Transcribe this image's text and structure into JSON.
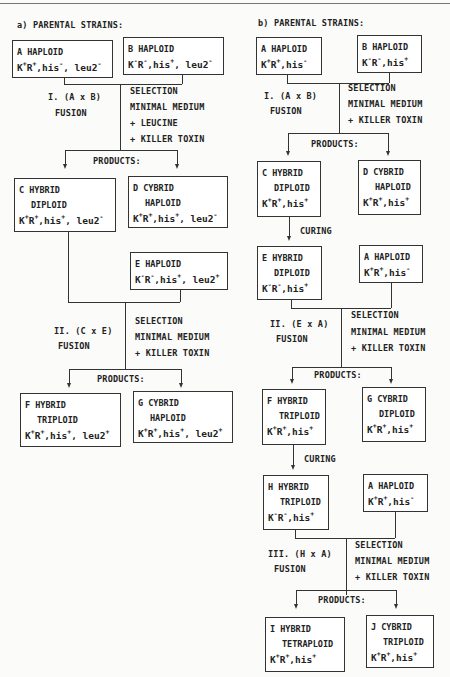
{
  "panel_a": {
    "title": "a) PARENTAL STRAINS:",
    "boxes": {
      "A": {
        "l1": "A HAPLOID",
        "g": [
          [
            "K",
            "+"
          ],
          [
            "R",
            "+"
          ],
          [
            ",his",
            "-"
          ],
          [
            ", leu2",
            "-"
          ]
        ]
      },
      "B": {
        "l1": "B HAPLOID",
        "g": [
          [
            "K",
            "-"
          ],
          [
            "R",
            "-"
          ],
          [
            ",his",
            "+"
          ],
          [
            ", leu2",
            "-"
          ]
        ]
      },
      "C": {
        "l1": "C HYBRID",
        "l2": "DIPLOID",
        "g": [
          [
            "K",
            "+"
          ],
          [
            "R",
            "+"
          ],
          [
            ",his",
            "+"
          ],
          [
            ", leu2",
            "-"
          ]
        ]
      },
      "D": {
        "l1": "D CYBRID",
        "l2": "HAPLOID",
        "g": [
          [
            "K",
            "+"
          ],
          [
            "R",
            "+"
          ],
          [
            ",his",
            "+"
          ],
          [
            ", leu2",
            "-"
          ]
        ]
      },
      "E": {
        "l1": "E HAPLOID",
        "g": [
          [
            "K",
            "-"
          ],
          [
            "R",
            "-"
          ],
          [
            ",his",
            "+"
          ],
          [
            ", leu2",
            "+"
          ]
        ]
      },
      "F": {
        "l1": "F HYBRID",
        "l2": "TRIPLOID",
        "g": [
          [
            "K",
            "+"
          ],
          [
            "R",
            "+"
          ],
          [
            ",his",
            "+"
          ],
          [
            ", leu2",
            "+"
          ]
        ]
      },
      "G": {
        "l1": "G CYBRID",
        "l2": "HAPLOID",
        "g": [
          [
            "K",
            "+"
          ],
          [
            "R",
            "+"
          ],
          [
            ",his",
            "+"
          ],
          [
            ", leu2",
            "+"
          ]
        ]
      }
    },
    "step1": {
      "cross": "I. (A x B)",
      "fusion": "FUSION",
      "sel": [
        "SELECTION",
        "MINIMAL MEDIUM",
        "+ LEUCINE",
        "+ KILLER TOXIN"
      ],
      "products": "PRODUCTS:"
    },
    "step2": {
      "cross": "II. (C x E)",
      "fusion": "FUSION",
      "sel": [
        "SELECTION",
        "MINIMAL MEDIUM",
        "+ KILLER TOXIN"
      ],
      "products": "PRODUCTS:"
    }
  },
  "panel_b": {
    "title": "b) PARENTAL STRAINS:",
    "boxes": {
      "A": {
        "l1": "A HAPLOID",
        "g": [
          [
            "K",
            "+"
          ],
          [
            "R",
            "+"
          ],
          [
            ",his",
            "-"
          ]
        ]
      },
      "B": {
        "l1": "B HAPLOID",
        "g": [
          [
            "K",
            "-"
          ],
          [
            "R",
            "-"
          ],
          [
            ",his",
            "+"
          ]
        ]
      },
      "C": {
        "l1": "C HYBRID",
        "l2": "DIPLOID",
        "g": [
          [
            "K",
            "+"
          ],
          [
            "R",
            "+"
          ],
          [
            ",his",
            "+"
          ]
        ]
      },
      "D": {
        "l1": "D CYBRID",
        "l2": "HAPLOID",
        "g": [
          [
            "K",
            "+"
          ],
          [
            "R",
            "+"
          ],
          [
            ",his",
            "+"
          ]
        ]
      },
      "E": {
        "l1": "E HYBRID",
        "l2": "DIPLOID",
        "g": [
          [
            "K",
            "-"
          ],
          [
            "R",
            "-"
          ],
          [
            ",his",
            "+"
          ]
        ]
      },
      "A2": {
        "l1": "A HAPLOID",
        "g": [
          [
            "K",
            "+"
          ],
          [
            "R",
            "+"
          ],
          [
            ",his",
            "-"
          ]
        ]
      },
      "F": {
        "l1": "F HYBRID",
        "l2": "TRIPLOID",
        "g": [
          [
            "K",
            "+"
          ],
          [
            "R",
            "+"
          ],
          [
            ",his",
            "+"
          ]
        ]
      },
      "G": {
        "l1": "G CYBRID",
        "l2": "DIPLOID",
        "g": [
          [
            "K",
            "+"
          ],
          [
            "R",
            "+"
          ],
          [
            ",his",
            "+"
          ]
        ]
      },
      "H": {
        "l1": "H HYBRID",
        "l2": "TRIPLOID",
        "g": [
          [
            "K",
            "-"
          ],
          [
            "R",
            "-"
          ],
          [
            ",his",
            "+"
          ]
        ]
      },
      "A3": {
        "l1": "A HAPLOID",
        "g": [
          [
            "K",
            "+"
          ],
          [
            "R",
            "+"
          ],
          [
            ",his",
            "-"
          ]
        ]
      },
      "I": {
        "l1": "I HYBRID",
        "l2": "TETRAPLOID",
        "g": [
          [
            "K",
            "+"
          ],
          [
            "R",
            "+"
          ],
          [
            ",his",
            "+"
          ]
        ]
      },
      "J": {
        "l1": "J CYBRID",
        "l2": "TRIPLOID",
        "g": [
          [
            "K",
            "+"
          ],
          [
            "R",
            "+"
          ],
          [
            ",his",
            "+"
          ]
        ]
      }
    },
    "step1": {
      "cross": "I. (A x B)",
      "fusion": "FUSION",
      "sel": [
        "SELECTION",
        "MINIMAL MEDIUM",
        "+ KILLER TOXIN"
      ],
      "products": "PRODUCTS:"
    },
    "curing1": "CURING",
    "step2": {
      "cross": "II. (E x A)",
      "fusion": "FUSION",
      "sel": [
        "SELECTION",
        "MINIMAL MEDIUM",
        "+ KILLER TOXIN"
      ],
      "products": "PRODUCTS:"
    },
    "curing2": "CURING",
    "step3": {
      "cross": "III. (H x A)",
      "fusion": "FUSION",
      "sel": [
        "SELECTION",
        "MINIMAL MEDIUM",
        "+ KILLER TOXIN"
      ],
      "products": "PRODUCTS:"
    }
  }
}
